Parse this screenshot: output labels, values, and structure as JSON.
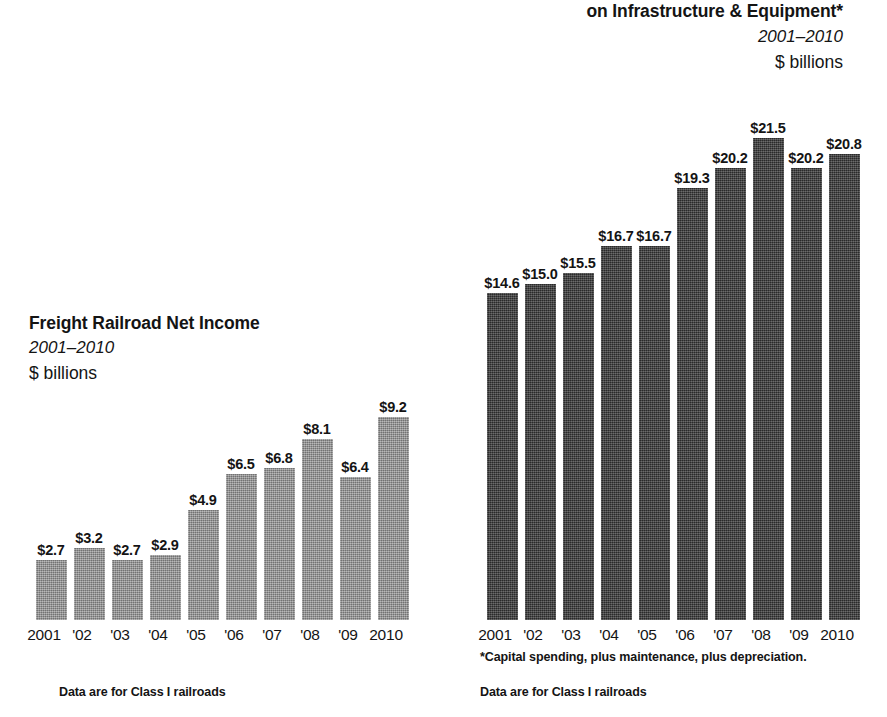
{
  "background_color": "#ffffff",
  "left_chart": {
    "title": "Freight Railroad Net Income",
    "subtitle": "2001–2010",
    "units": "$ billions",
    "source_note": "Data are for Class I railroads",
    "bar_color": "#8d8d8d"
  },
  "right_chart": {
    "title": "on Infrastructure & Equipment*",
    "subtitle": "2001–2010",
    "units": "$ billions",
    "footnote": "*Capital spending, plus maintenance, plus depreciation.",
    "source_note": "Data are for Class I railroads",
    "bar_color": "#3b3b3b"
  },
  "chart_data": [
    {
      "type": "bar",
      "title": "Freight Railroad Net Income",
      "subtitle": "2001–2010",
      "xlabel": "",
      "ylabel": "$ billions",
      "ylim": [
        0,
        9.6
      ],
      "grid": false,
      "legend": "none",
      "bar_color": "#8d8d8d",
      "categories": [
        "2001",
        "'02",
        "'03",
        "'04",
        "'05",
        "'06",
        "'07",
        "'08",
        "'09",
        "2010"
      ],
      "values": [
        2.7,
        3.2,
        2.7,
        2.9,
        4.9,
        6.5,
        6.8,
        8.1,
        6.4,
        9.2
      ],
      "data_labels": [
        "$2.7",
        "$3.2",
        "$2.7",
        "$2.9",
        "$4.9",
        "$6.5",
        "$6.8",
        "$8.1",
        "$6.4",
        "$9.2"
      ],
      "annotations": [
        "Data are for Class I railroads"
      ]
    },
    {
      "type": "bar",
      "title": "on Infrastructure & Equipment*",
      "subtitle": "2001–2010",
      "xlabel": "",
      "ylabel": "$ billions",
      "ylim": [
        0,
        22.5
      ],
      "grid": false,
      "legend": "none",
      "bar_color": "#3b3b3b",
      "categories": [
        "2001",
        "'02",
        "'03",
        "'04",
        "'05",
        "'06",
        "'07",
        "'08",
        "'09",
        "2010"
      ],
      "values": [
        14.6,
        15.0,
        15.5,
        16.7,
        16.7,
        19.3,
        20.2,
        21.5,
        20.2,
        20.8
      ],
      "data_labels": [
        "$14.6",
        "$15.0",
        "$15.5",
        "$16.7",
        "$16.7",
        "$19.3",
        "$20.2",
        "$21.5",
        "$20.2",
        "$20.8"
      ],
      "annotations": [
        "*Capital spending, plus maintenance, plus depreciation.",
        "Data are for Class I railroads"
      ]
    }
  ]
}
